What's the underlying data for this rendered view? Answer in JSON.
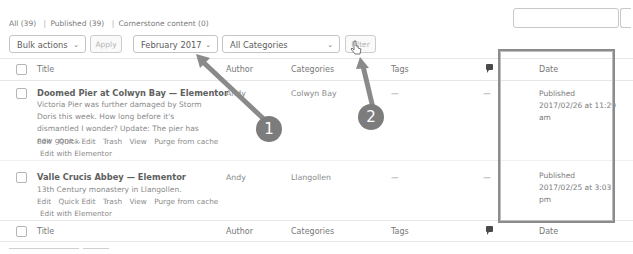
{
  "views": {
    "all": "All (39)",
    "sep1": "|",
    "published": "Published (39)",
    "sep2": "|",
    "cornerstone": "Cornerstone content (0)"
  },
  "search": {
    "value": "",
    "placeholder": ""
  },
  "tablenav": {
    "bulk_actions": "Bulk actions",
    "apply": "Apply",
    "month_filter": "February 2017",
    "category_filter": "All Categories",
    "filter": "Filter",
    "chevron": "⌄"
  },
  "columns": {
    "title": "Title",
    "author": "Author",
    "categories": "Categories",
    "tags": "Tags",
    "comments_icon": "comment-icon",
    "date": "Date"
  },
  "posts": [
    {
      "title": "Doomed Pier at Colwyn Bay — Elementor",
      "excerpt": "Victoria Pier was further damaged by Storm Doris this week.  How long before it's dismantled I wonder?  Update: The pier has now gone...",
      "row_actions": [
        "Edit",
        "Quick Edit",
        "Trash",
        "View",
        "Purge from cache",
        "Edit with Elementor"
      ],
      "author": "Andy",
      "categories": "Colwyn Bay",
      "tags": "—",
      "comments": "—",
      "date_status": "Published",
      "date_value": "2017/02/26 at 11:29 am"
    },
    {
      "title": "Valle Crucis Abbey — Elementor",
      "excerpt": "13th Century monastery in Llangollen.",
      "row_actions": [
        "Edit",
        "Quick Edit",
        "Trash",
        "View",
        "Purge from cache",
        "Edit with Elementor"
      ],
      "author": "Andy",
      "categories": "Llangollen",
      "tags": "—",
      "comments": "—",
      "date_status": "Published",
      "date_value": "2017/02/25 at 3:03 pm"
    }
  ],
  "annotations": {
    "step1": "1",
    "step2": "2",
    "arrow_color": "#8a8a8a",
    "highlight_color": "#8c8c8c"
  }
}
